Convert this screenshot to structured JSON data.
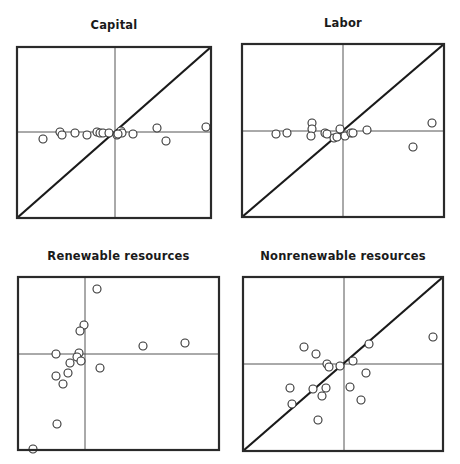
{
  "chart_data": [
    {
      "type": "scatter",
      "title": "Capital",
      "xlabel": "",
      "ylabel": "",
      "xlim": [
        -1,
        1
      ],
      "ylim": [
        -1,
        1
      ],
      "grid": false,
      "reference_lines": [
        "x=0",
        "y=0",
        "y=x diagonal"
      ],
      "points": [
        {
          "x": -0.72,
          "y": -0.07
        },
        {
          "x": -0.55,
          "y": 0.0
        },
        {
          "x": -0.53,
          "y": -0.03
        },
        {
          "x": -0.4,
          "y": -0.01
        },
        {
          "x": -0.28,
          "y": -0.03
        },
        {
          "x": -0.18,
          "y": 0.0
        },
        {
          "x": -0.15,
          "y": -0.01
        },
        {
          "x": -0.12,
          "y": -0.01
        },
        {
          "x": -0.06,
          "y": -0.01
        },
        {
          "x": 0.02,
          "y": -0.03
        },
        {
          "x": 0.06,
          "y": 0.01
        },
        {
          "x": 0.07,
          "y": -0.01
        },
        {
          "x": 0.18,
          "y": -0.02
        },
        {
          "x": 0.42,
          "y": 0.04
        },
        {
          "x": 0.51,
          "y": -0.09
        },
        {
          "x": 0.91,
          "y": 0.05
        },
        {
          "x": 0.03,
          "y": -0.02
        }
      ]
    },
    {
      "type": "scatter",
      "title": "Labor",
      "xlabel": "",
      "ylabel": "",
      "xlim": [
        -1,
        1
      ],
      "ylim": [
        -1,
        1
      ],
      "grid": false,
      "reference_lines": [
        "x=0",
        "y=0",
        "y=x diagonal"
      ],
      "points": [
        {
          "x": -0.67,
          "y": -0.03
        },
        {
          "x": -0.56,
          "y": -0.02
        },
        {
          "x": -0.31,
          "y": 0.08
        },
        {
          "x": -0.31,
          "y": 0.02
        },
        {
          "x": -0.32,
          "y": -0.05
        },
        {
          "x": -0.18,
          "y": -0.02
        },
        {
          "x": -0.16,
          "y": -0.03
        },
        {
          "x": -0.09,
          "y": -0.07
        },
        {
          "x": -0.06,
          "y": -0.06
        },
        {
          "x": -0.03,
          "y": 0.02
        },
        {
          "x": 0.02,
          "y": -0.05
        },
        {
          "x": 0.08,
          "y": -0.02
        },
        {
          "x": 0.1,
          "y": -0.02
        },
        {
          "x": 0.24,
          "y": 0.01
        },
        {
          "x": 0.7,
          "y": -0.16
        },
        {
          "x": 0.89,
          "y": 0.08
        }
      ]
    },
    {
      "type": "scatter",
      "title": "Renewable resources",
      "xlabel": "",
      "ylabel": "",
      "xlim": [
        -1,
        1
      ],
      "ylim": [
        -1,
        1
      ],
      "grid": false,
      "reference_lines": [
        "x=0",
        "y=0"
      ],
      "points": [
        {
          "x": 0.12,
          "y": 0.65
        },
        {
          "x": -0.01,
          "y": 0.29
        },
        {
          "x": -0.05,
          "y": 0.23
        },
        {
          "x": -0.06,
          "y": 0.01
        },
        {
          "x": -0.29,
          "y": 0.0
        },
        {
          "x": -0.08,
          "y": -0.03
        },
        {
          "x": -0.04,
          "y": -0.07
        },
        {
          "x": -0.15,
          "y": -0.09
        },
        {
          "x": -0.17,
          "y": -0.19
        },
        {
          "x": -0.29,
          "y": -0.22
        },
        {
          "x": -0.22,
          "y": -0.3
        },
        {
          "x": 0.15,
          "y": -0.14
        },
        {
          "x": 0.58,
          "y": 0.08
        },
        {
          "x": 1.0,
          "y": 0.11
        },
        {
          "x": -0.28,
          "y": -0.7
        },
        {
          "x": -0.52,
          "y": -0.95
        }
      ]
    },
    {
      "type": "scatter",
      "title": "Nonrenewable resources",
      "xlabel": "",
      "ylabel": "",
      "xlim": [
        -1,
        1
      ],
      "ylim": [
        -1,
        1
      ],
      "grid": false,
      "reference_lines": [
        "x=0",
        "y=0",
        "y=x diagonal"
      ],
      "points": [
        {
          "x": -0.4,
          "y": 0.17
        },
        {
          "x": -0.28,
          "y": 0.1
        },
        {
          "x": 0.25,
          "y": 0.2
        },
        {
          "x": 0.09,
          "y": 0.03
        },
        {
          "x": 0.89,
          "y": 0.27
        },
        {
          "x": -0.17,
          "y": 0.0
        },
        {
          "x": -0.15,
          "y": -0.03
        },
        {
          "x": -0.04,
          "y": -0.02
        },
        {
          "x": 0.22,
          "y": -0.09
        },
        {
          "x": -0.54,
          "y": -0.24
        },
        {
          "x": -0.31,
          "y": -0.25
        },
        {
          "x": -0.18,
          "y": -0.24
        },
        {
          "x": -0.22,
          "y": -0.32
        },
        {
          "x": 0.06,
          "y": -0.23
        },
        {
          "x": -0.52,
          "y": -0.4
        },
        {
          "x": 0.17,
          "y": -0.36
        },
        {
          "x": -0.26,
          "y": -0.56
        }
      ]
    }
  ]
}
